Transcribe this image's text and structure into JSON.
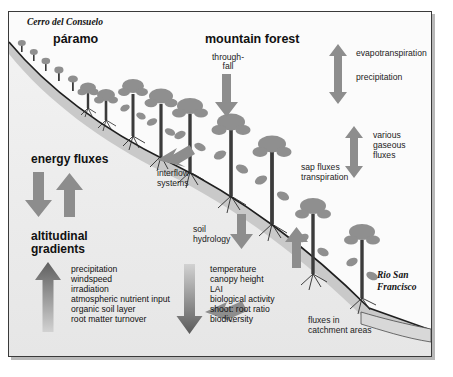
{
  "figure": {
    "place_top_left": "Cerro del Consuelo",
    "place_bottom_right_line1": "Rio San",
    "place_bottom_right_line2": "Francisco",
    "zone_left": "páramo",
    "zone_right": "mountain forest",
    "labels": {
      "throughfall_line1": "through-",
      "throughfall_line2": "fall",
      "evapotranspiration": "evapotranspiration",
      "precipitation": "precipitation",
      "various_gaseous_fluxes_line1": "various",
      "various_gaseous_fluxes_line2": "gaseous",
      "various_gaseous_fluxes_line3": "fluxes",
      "sap_fluxes": "sap fluxes",
      "transpiration": "transpiration",
      "interflow_line1": "interflow",
      "interflow_line2": "systems",
      "soil_line1": "soil",
      "soil_line2": "hydrology",
      "energy_fluxes": "energy fluxes",
      "altitudinal_line1": "altitudinal",
      "altitudinal_line2": "gradients",
      "catchment_line1": "fluxes in",
      "catchment_line2": "catchment areas"
    },
    "gradient_increasing": [
      "precipitation",
      "windspeed",
      "irradiation",
      "atmospheric nutrient input",
      "organic soil layer",
      "root matter turnover"
    ],
    "gradient_decreasing": [
      "temperature",
      "canopy height",
      "LAI",
      "biological activity",
      "shoot: root ratio",
      "biodiversity"
    ],
    "colors": {
      "arrow_gray": "#8d8d8d",
      "canopy_gray": "#8f8f8f",
      "trunk_dark": "#3b3b3b",
      "soil_band": "#c9c9c9",
      "below_ground": "#eeeeee",
      "frame_border": "#3a3a3a"
    }
  },
  "caption": {
    "text": ""
  }
}
